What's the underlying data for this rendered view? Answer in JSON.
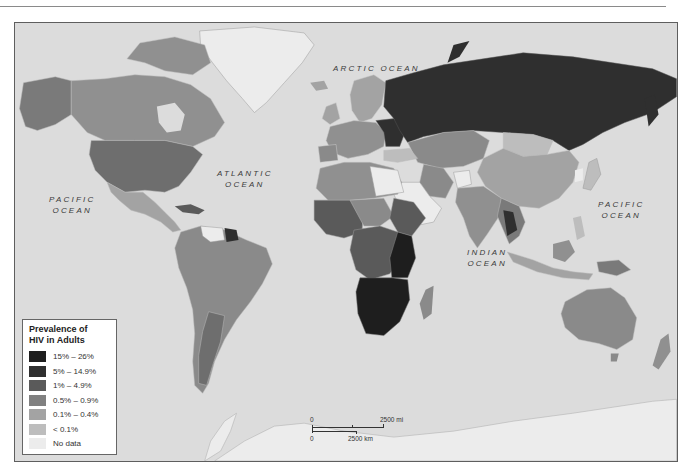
{
  "map": {
    "legend": {
      "title_line1": "Prevalence of",
      "title_line2": "HIV in Adults",
      "items": [
        {
          "label": "15% – 26%",
          "color": "#1e1e1e"
        },
        {
          "label": "5% – 14.9%",
          "color": "#2f2f2f"
        },
        {
          "label": "1% – 4.9%",
          "color": "#5a5a5a"
        },
        {
          "label": "0.5% – 0.9%",
          "color": "#808080"
        },
        {
          "label": "0.1% – 0.4%",
          "color": "#a3a3a3"
        },
        {
          "label": "< 0.1%",
          "color": "#bdbdbd"
        },
        {
          "label": "No data",
          "color": "#ececec"
        }
      ]
    },
    "ocean_labels": {
      "arctic": "ARCTIC OCEAN",
      "atlantic_line1": "ATLANTIC",
      "atlantic_line2": "OCEAN",
      "pacific_west_line1": "PACIFIC",
      "pacific_west_line2": "OCEAN",
      "pacific_east_line1": "PACIFIC",
      "pacific_east_line2": "OCEAN",
      "indian_line1": "INDIAN",
      "indian_line2": "OCEAN"
    },
    "scale": {
      "zero_top": "0",
      "miles_label": "2500 mi",
      "zero_bottom": "0",
      "km_label": "2500 km"
    },
    "colors": {
      "ocean": "#dcdcdc",
      "frame_border": "#5e5e5e"
    }
  }
}
